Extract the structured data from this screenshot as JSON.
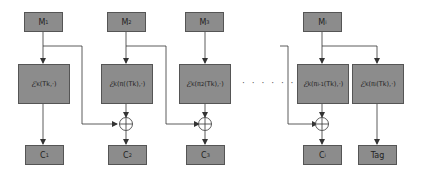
{
  "diagram": {
    "inputs": [
      {
        "label": "M",
        "sub": "1"
      },
      {
        "label": "M",
        "sub": "2"
      },
      {
        "label": "M",
        "sub": "3"
      },
      {
        "label": "M",
        "sub": "i"
      }
    ],
    "encryptions": [
      {
        "E": "ℰ",
        "key": "K",
        "arg": "(Tk,·)",
        "prefix": "",
        "power": ""
      },
      {
        "E": "ℰ",
        "key": "K",
        "arg": "(Tk),·)",
        "prefix": "(π(",
        "power": ""
      },
      {
        "E": "ℰ",
        "key": "K",
        "arg": "(Tk),·)",
        "prefix": "(π",
        "power": "2"
      },
      {
        "E": "ℰ",
        "key": "K",
        "arg": "(Tk),·)",
        "prefix": "(π",
        "power": "i-1"
      },
      {
        "E": "ℰ",
        "key": "K",
        "arg": "(Tk),·)",
        "prefix": "(π",
        "power": "i"
      }
    ],
    "outputs": [
      {
        "label": "C",
        "sub": "1"
      },
      {
        "label": "C",
        "sub": "2"
      },
      {
        "label": "C",
        "sub": "3"
      },
      {
        "label": "C",
        "sub": "i"
      },
      {
        "label": "Tag",
        "sub": ""
      }
    ],
    "ellipsis": "· · · · · ·",
    "colors": {
      "box_fill": "#8c8c8c",
      "box_border": "#555555",
      "line": "#333333"
    }
  }
}
